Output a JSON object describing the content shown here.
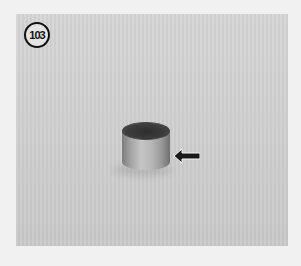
{
  "figure": {
    "number": "103",
    "pointer": "arrow-left"
  },
  "colors": {
    "page_background": "#f1f1f1",
    "photo_background": "#d2d2d2",
    "label_border": "#111111"
  }
}
